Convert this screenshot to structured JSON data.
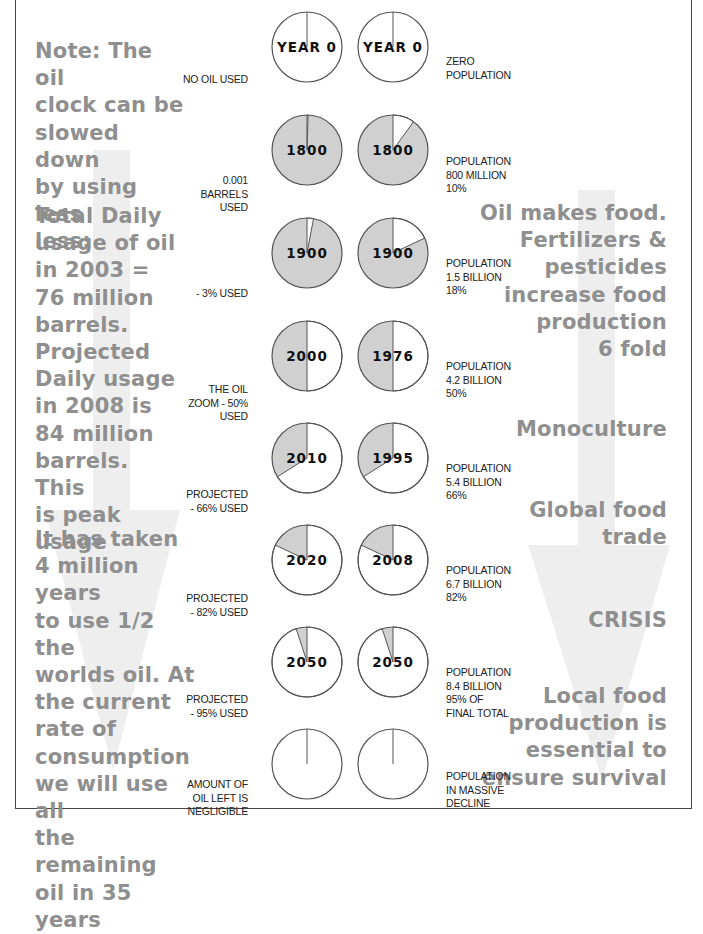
{
  "colors": {
    "background": "#ffffff",
    "frame": "#444444",
    "pie_filled": "#d0d0d0",
    "pie_empty": "#ffffff",
    "pie_stroke": "#555555",
    "side_text": "#8f8f8f",
    "arrow": "#eeeeee",
    "label_text": "#222222"
  },
  "left_panel": {
    "note": [
      "Note: The oil",
      "clock can be",
      "slowed down",
      "by using less",
      "less:"
    ],
    "daily_usage": [
      "Total Daily",
      "usage of oil",
      "in 2003 =",
      "76 million",
      "barrels.",
      "Projected",
      "Daily usage",
      "in 2008 is",
      "84 million",
      "barrels. This",
      "is peak usage"
    ],
    "time_taken": [
      "It has taken",
      "4 million years",
      "to use 1/2 the",
      "worlds oil. At",
      "the current",
      "rate of",
      "consumption",
      "we will use all",
      "the remaining",
      "oil in 35 years"
    ]
  },
  "right_panel": {
    "oil_food": [
      "Oil makes food.",
      "Fertilizers &",
      "pesticides",
      "increase food",
      "production",
      "6 fold"
    ],
    "monoculture": "Monoculture",
    "global_trade": [
      "Global food",
      "trade"
    ],
    "crisis": "CRISIS",
    "local_food": [
      "Local food",
      "production is",
      "essential to",
      "ensure survival"
    ]
  },
  "chart_data": {
    "type": "pie",
    "rows": [
      {
        "oil_year": "YEAR 0",
        "oil_used_pct": 0,
        "oil_label": [
          "NO OIL USED"
        ],
        "pop_year": "YEAR 0",
        "pop_pct": 0,
        "pop_label": [
          "ZERO",
          "POPULATION"
        ],
        "filled": false
      },
      {
        "oil_year": "1800",
        "oil_used_pct": 0.5,
        "oil_label": [
          "0.001",
          "BARRELS",
          "USED"
        ],
        "pop_year": "1800",
        "pop_pct": 10,
        "pop_label": [
          "POPULATION",
          "800 MILLION",
          "10%"
        ],
        "filled": true
      },
      {
        "oil_year": "1900",
        "oil_used_pct": 3,
        "oil_label": [
          "- 3% USED"
        ],
        "pop_year": "1900",
        "pop_pct": 18,
        "pop_label": [
          "POPULATION",
          "1.5 BILLION",
          "18%"
        ],
        "filled": true
      },
      {
        "oil_year": "2000",
        "oil_used_pct": 50,
        "oil_label": [
          "THE OIL",
          "ZOOM - 50%",
          "USED"
        ],
        "pop_year": "1976",
        "pop_pct": 50,
        "pop_label": [
          "POPULATION",
          "4.2 BILLION",
          "50%"
        ],
        "filled": true
      },
      {
        "oil_year": "2010",
        "oil_used_pct": 66,
        "oil_label": [
          "PROJECTED",
          "- 66% USED"
        ],
        "pop_year": "1995",
        "pop_pct": 66,
        "pop_label": [
          "POPULATION",
          "5.4 BILLION",
          "66%"
        ],
        "filled": true
      },
      {
        "oil_year": "2020",
        "oil_used_pct": 82,
        "oil_label": [
          "PROJECTED",
          "- 82% USED"
        ],
        "pop_year": "2008",
        "pop_pct": 82,
        "pop_label": [
          "POPULATION",
          "6.7 BILLION",
          "82%"
        ],
        "filled": true
      },
      {
        "oil_year": "2050",
        "oil_used_pct": 95,
        "oil_label": [
          "PROJECTED",
          "- 95% USED"
        ],
        "pop_year": "2050",
        "pop_pct": 95,
        "pop_label": [
          "POPULATION",
          "8.4 BILLION",
          "95% OF",
          "FINAL TOTAL"
        ],
        "filled": true
      },
      {
        "oil_year": "",
        "oil_used_pct": 100,
        "oil_label": [
          "AMOUNT OF",
          "OIL LEFT IS",
          "NEGLIGIBLE"
        ],
        "pop_year": "",
        "pop_pct": 100,
        "pop_label": [
          "POPULATION",
          "IN MASSIVE",
          "DECLINE"
        ],
        "filled": false
      }
    ]
  }
}
